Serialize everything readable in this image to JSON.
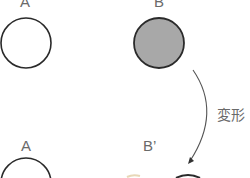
{
  "top": {
    "label_a": "A",
    "label_b": "B"
  },
  "arrow": {
    "label": "変形"
  },
  "bottom": {
    "label_a": "A",
    "label_b_prime": "B’"
  },
  "colors": {
    "outline": "#2a2a2a",
    "b_fill": "#a8a8a8",
    "text": "#6a6a6a"
  }
}
